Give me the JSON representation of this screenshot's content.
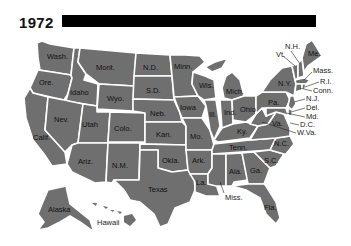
{
  "header": {
    "year": "1972"
  },
  "map": {
    "fill_color": "#6f6f6f",
    "border_color": "#ffffff",
    "title_bar_color": "#000000",
    "states": [
      {
        "id": "wa",
        "label": "Wash."
      },
      {
        "id": "or",
        "label": "Ore."
      },
      {
        "id": "ca",
        "label": "Calif."
      },
      {
        "id": "id",
        "label": "Idaho"
      },
      {
        "id": "nv",
        "label": "Nev."
      },
      {
        "id": "mt",
        "label": "Mont."
      },
      {
        "id": "wy",
        "label": "Wyo."
      },
      {
        "id": "ut",
        "label": "Utah"
      },
      {
        "id": "az",
        "label": "Ariz."
      },
      {
        "id": "co",
        "label": "Colo."
      },
      {
        "id": "nm",
        "label": "N.M."
      },
      {
        "id": "nd",
        "label": "N.D."
      },
      {
        "id": "sd",
        "label": "S.D."
      },
      {
        "id": "ne",
        "label": "Neb."
      },
      {
        "id": "ks",
        "label": "Kan."
      },
      {
        "id": "ok",
        "label": "Okla."
      },
      {
        "id": "tx",
        "label": "Texas"
      },
      {
        "id": "mn",
        "label": "Minn."
      },
      {
        "id": "ia",
        "label": "Iowa"
      },
      {
        "id": "mo",
        "label": "Mo."
      },
      {
        "id": "ar",
        "label": "Ark."
      },
      {
        "id": "la",
        "label": "La."
      },
      {
        "id": "wi",
        "label": "Wis."
      },
      {
        "id": "il",
        "label": "Ill."
      },
      {
        "id": "mi",
        "label": "Mich."
      },
      {
        "id": "in",
        "label": "Ind."
      },
      {
        "id": "oh",
        "label": "Ohio"
      },
      {
        "id": "ky",
        "label": "Ky."
      },
      {
        "id": "tn",
        "label": "Tenn."
      },
      {
        "id": "ms",
        "label": "Miss."
      },
      {
        "id": "al",
        "label": "Ala."
      },
      {
        "id": "ga",
        "label": "Ga."
      },
      {
        "id": "fl",
        "label": "Fla."
      },
      {
        "id": "sc",
        "label": "S.C."
      },
      {
        "id": "nc",
        "label": "N.C."
      },
      {
        "id": "va",
        "label": "Va."
      },
      {
        "id": "wv",
        "label": "W.Va."
      },
      {
        "id": "pa",
        "label": "Pa."
      },
      {
        "id": "ny",
        "label": "N.Y."
      },
      {
        "id": "vt",
        "label": "Vt."
      },
      {
        "id": "nh",
        "label": "N.H."
      },
      {
        "id": "me",
        "label": "Me."
      },
      {
        "id": "ma",
        "label": "Mass."
      },
      {
        "id": "ri",
        "label": "R.I."
      },
      {
        "id": "ct",
        "label": "Conn."
      },
      {
        "id": "nj",
        "label": "N.J."
      },
      {
        "id": "de",
        "label": "Del."
      },
      {
        "id": "md",
        "label": "Md."
      },
      {
        "id": "dc",
        "label": "D.C."
      },
      {
        "id": "ak",
        "label": "Alaska"
      },
      {
        "id": "hi",
        "label": "Hawaii"
      }
    ]
  }
}
